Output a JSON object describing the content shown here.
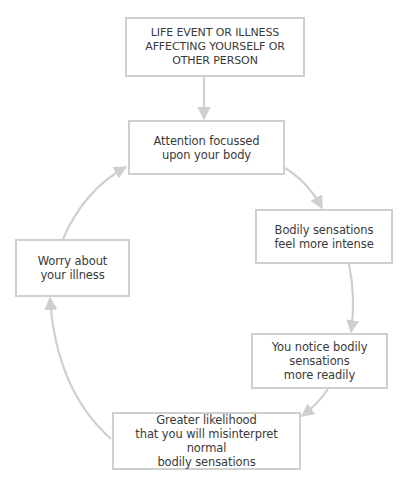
{
  "diagram": {
    "type": "cycle-flowchart",
    "colors": {
      "box_border": "#cfcfcf",
      "arrow": "#cfcfcf",
      "text": "#3a3a3a",
      "background": "#ffffff"
    },
    "nodes": [
      {
        "id": "trigger",
        "label": "LIFE EVENT OR ILLNESS\nAFFECTING YOURSELF OR\nOTHER PERSON"
      },
      {
        "id": "attention",
        "label": "Attention focussed\nupon your body"
      },
      {
        "id": "intense",
        "label": "Bodily sensations\nfeel more intense"
      },
      {
        "id": "notice",
        "label": "You notice bodily\nsensations\nmore readily"
      },
      {
        "id": "misinterpret",
        "label": "Greater likelihood\nthat you will misinterpret normal\nbodily sensations"
      },
      {
        "id": "worry",
        "label": "Worry about\nyour illness"
      }
    ],
    "edges": [
      {
        "from": "trigger",
        "to": "attention"
      },
      {
        "from": "attention",
        "to": "intense"
      },
      {
        "from": "intense",
        "to": "notice"
      },
      {
        "from": "notice",
        "to": "misinterpret"
      },
      {
        "from": "misinterpret",
        "to": "worry"
      },
      {
        "from": "worry",
        "to": "attention"
      }
    ]
  }
}
